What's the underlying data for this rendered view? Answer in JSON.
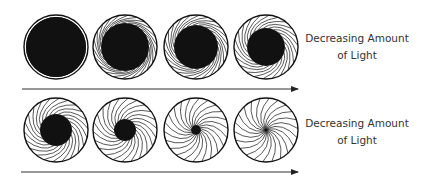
{
  "figure": {
    "rows": [
      {
        "label_line1": "Decreasing Amount",
        "label_line2": "of Light",
        "arrow": {
          "x1": 22,
          "x2": 298,
          "y": 89
        },
        "apertures": [
          {
            "cx": 56,
            "cy": 47,
            "r": 32,
            "pupil_r": 30,
            "blades": false
          },
          {
            "cx": 125,
            "cy": 47,
            "r": 32,
            "pupil_r": 24,
            "blades": true
          },
          {
            "cx": 196,
            "cy": 47,
            "r": 32,
            "pupil_r": 22,
            "blades": true
          },
          {
            "cx": 266,
            "cy": 47,
            "r": 32,
            "pupil_r": 19,
            "blades": true
          }
        ]
      },
      {
        "label_line1": "Decreasing Amount",
        "label_line2": "of Light",
        "arrow": {
          "x1": 21,
          "x2": 298,
          "y": 172
        },
        "apertures": [
          {
            "cx": 56,
            "cy": 130,
            "r": 32,
            "pupil_r": 16,
            "blades": true
          },
          {
            "cx": 125,
            "cy": 130,
            "r": 32,
            "pupil_r": 11,
            "blades": true
          },
          {
            "cx": 196,
            "cy": 130,
            "r": 32,
            "pupil_r": 5,
            "blades": true
          },
          {
            "cx": 266,
            "cy": 130,
            "r": 32,
            "pupil_r": 2,
            "blades": true
          }
        ]
      }
    ],
    "colors": {
      "ink": "#111111",
      "paper": "#ffffff",
      "text": "#333333"
    }
  }
}
